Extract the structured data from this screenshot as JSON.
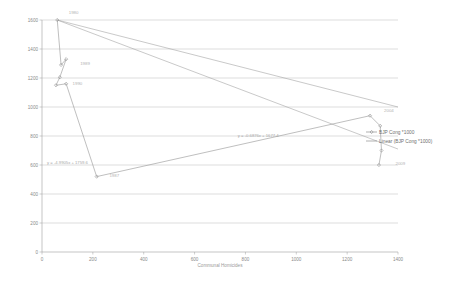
{
  "chart_data": {
    "type": "scatter",
    "title": "",
    "subtitle": "",
    "xlabel": "Communal Homicides",
    "ylabel": "",
    "xlim": [
      0,
      1400
    ],
    "ylim": [
      0,
      1600
    ],
    "grid": true,
    "legend_position": "right",
    "x_ticks": [
      "0",
      "200",
      "400",
      "600",
      "800",
      "1000",
      "1200",
      "1400"
    ],
    "x_tick_values": [
      0,
      200,
      400,
      600,
      800,
      1000,
      1200,
      1400
    ],
    "y_ticks": [
      "0",
      "200",
      "400",
      "600",
      "800",
      "1000",
      "1200",
      "1400",
      "1600"
    ],
    "y_tick_values": [
      0,
      200,
      400,
      600,
      800,
      1000,
      1200,
      1400,
      1600
    ],
    "series": [
      {
        "name": "BJP Cong *1000",
        "type": "scatter-line",
        "color": "#9c9c9c",
        "points": [
          {
            "x": 60,
            "y": 1600,
            "label": "1980"
          },
          {
            "x": 75,
            "y": 1290,
            "label": "1989"
          },
          {
            "x": 95,
            "y": 1330,
            "label": ""
          },
          {
            "x": 70,
            "y": 1205,
            "label": ""
          },
          {
            "x": 55,
            "y": 1150,
            "label": "1990"
          },
          {
            "x": 95,
            "y": 1160,
            "label": ""
          },
          {
            "x": 215,
            "y": 520,
            "label": "1987"
          },
          {
            "x": 1290,
            "y": 940,
            "label": "2004"
          },
          {
            "x": 1330,
            "y": 870,
            "label": ""
          },
          {
            "x": 1335,
            "y": 700,
            "label": ""
          },
          {
            "x": 1325,
            "y": 600,
            "label": "2009"
          }
        ]
      },
      {
        "name": "Linear (BJP Cong *1000)",
        "type": "trendline",
        "color": "#a5a5a5",
        "equation": "y = -0.6876x + 1677.4",
        "r2": "R² = 0.982",
        "from": {
          "x": 60,
          "y": 1600
        },
        "to": {
          "x": 1400,
          "y": 710
        }
      },
      {
        "name": "Linear (secondary)",
        "type": "trendline",
        "color": "#a5a5a5",
        "equation": "y = -4.9905x + 1759.6",
        "r2": "R² = 0.8138",
        "from": {
          "x": 60,
          "y": 1600
        },
        "to": {
          "x": 1400,
          "y": 1000
        }
      }
    ],
    "annotations": [
      {
        "id": "eq-right",
        "line1": "y = -0.6876x + 1677.4",
        "line2": "R² = 0.982",
        "x": 770,
        "y": 790
      },
      {
        "id": "eq-left",
        "line1": "y = -4.9905x + 1759.6",
        "line2": "R² = 0.8138",
        "x": 20,
        "y": 610
      }
    ],
    "point_labels": [
      {
        "text": "1980",
        "x": 105,
        "y": 1640
      },
      {
        "text": "1989",
        "x": 150,
        "y": 1290
      },
      {
        "text": "1990",
        "x": 120,
        "y": 1150
      },
      {
        "text": "1987",
        "x": 265,
        "y": 520
      },
      {
        "text": "2004",
        "x": 1345,
        "y": 965
      },
      {
        "text": "2009",
        "x": 1390,
        "y": 600
      }
    ]
  },
  "legend": {
    "entries": [
      {
        "label": "BJP Cong *1000",
        "marker": "line-marker",
        "color": "#8f8f8f"
      },
      {
        "label": "Linear (BJP Cong *1000)",
        "marker": "line",
        "color": "#8f8f8f"
      }
    ]
  },
  "axes": {
    "x_title": "Communal Homicides",
    "y_title": ""
  }
}
